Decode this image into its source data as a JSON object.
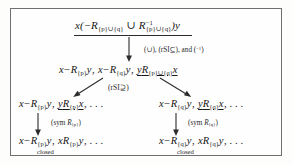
{
  "figure": {
    "kind": "proof-tree",
    "border_color": "#6f6f6f",
    "background": "#fefefe"
  },
  "nodes": {
    "root": {
      "name": "root-sequent",
      "text": "x(−R{p}∪{q} ∪ R⁻¹{p}∪{q})y",
      "parts": {
        "lead": "x(",
        "minus": "−",
        "R1": "R",
        "sub1": "{p}∪{q}",
        "union": "∪",
        "R2": "R",
        "sup2": "−1",
        "sub2": "{p}∪{q}",
        "tail": ")y"
      },
      "underlined": true
    },
    "level2": {
      "name": "second-sequent",
      "text": "x−R{p}y, x−R{q}y, yR{p}∪{q}x",
      "parts": {
        "t1_x": "x",
        "t1_minus": "−",
        "t1_R": "R",
        "t1_sub": "{p}",
        "t1_y": "y",
        "comma1": ", ",
        "t2_x": "x",
        "t2_minus": "−",
        "t2_R": "R",
        "t2_sub": "{q}",
        "t2_y": "y",
        "comma2": ", ",
        "t3_y": "y",
        "t3_R": "R",
        "t3_sub": "{p}∪{q}",
        "t3_x": "x"
      },
      "underlined_term": "yR{p}∪{q}x"
    },
    "level3_left": {
      "name": "third-sequent-left",
      "parts": {
        "t1_x": "x",
        "t1_minus": "−",
        "t1_R": "R",
        "t1_sub": "{p}",
        "t1_y": "y",
        "comma1": ", ",
        "t2_y": "y",
        "t2_R": "R",
        "t2_sub": "{p}",
        "t2_x": "x",
        "ellipsis": ", . . ."
      }
    },
    "level3_right": {
      "name": "third-sequent-right",
      "parts": {
        "t1_x": "x",
        "t1_minus": "−",
        "t1_R": "R",
        "t1_sub": "{q}",
        "t1_y": "y",
        "comma1": ", ",
        "t2_y": "y",
        "t2_R": "R",
        "t2_sub": "{q}",
        "t2_x": "x",
        "ellipsis": ", . . ."
      }
    },
    "level4_left": {
      "name": "leaf-sequent-left",
      "parts": {
        "t1_x": "x",
        "t1_minus": "−",
        "t1_R": "R",
        "t1_sub": "{p}",
        "t1_y": "y",
        "comma1": ", ",
        "t2_x": "x",
        "t2_R": "R",
        "t2_sub": "{p}",
        "t2_y": "y",
        "ellipsis": ", . . ."
      },
      "caption": "closed"
    },
    "level4_right": {
      "name": "leaf-sequent-right",
      "parts": {
        "t1_x": "x",
        "t1_minus": "−",
        "t1_R": "R",
        "t1_sub": "{q}",
        "t1_y": "y",
        "comma1": ", ",
        "t2_x": "x",
        "t2_R": "R",
        "t2_sub": "{q}",
        "t2_y": "y",
        "ellipsis": ", . . ."
      },
      "caption": "closed"
    }
  },
  "rule_labels": {
    "top": {
      "name": "rule-label-top",
      "parts": {
        "union": "(∪), ",
        "rsi": "(rSI⊆)",
        "and": ", and ",
        "inv_open": "(",
        "inv_sup": "−1",
        "inv_close": ")"
      },
      "plain": "(∪), (rSI⊆), and (−1)"
    },
    "middle": {
      "name": "rule-label-middle",
      "plain": "(rSI⊇)"
    },
    "left_sym": {
      "name": "rule-label-sym-left",
      "prefix": "(sym ",
      "R": "R",
      "sub": "{p}",
      "suffix": ")"
    },
    "right_sym": {
      "name": "rule-label-sym-right",
      "prefix": "(sym ",
      "R": "R",
      "sub": "{q}",
      "suffix": ")"
    }
  }
}
